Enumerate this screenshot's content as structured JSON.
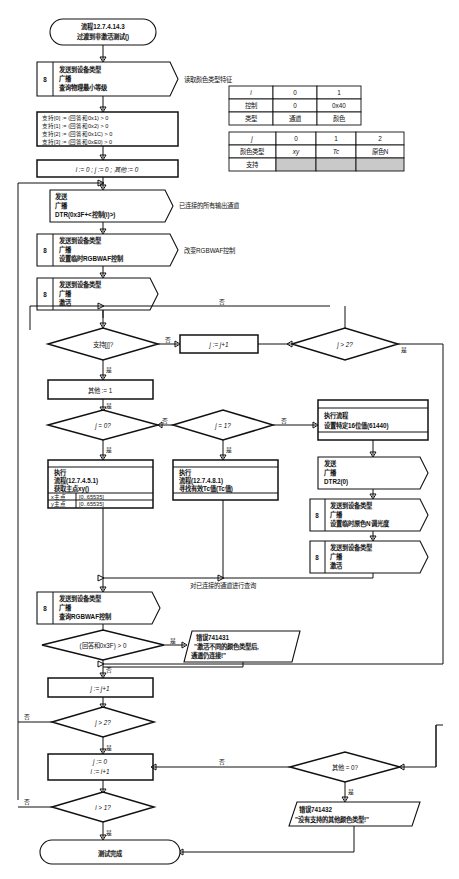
{
  "diagram": {
    "terminator_start_line1": "流程12.7.4.14.3",
    "terminator_start_line2": "过渡到非激活测试()",
    "terminator_end": "测试完成"
  },
  "nodes": {
    "cmd_query_min_level": {
      "badge": "8",
      "line1": "发送到设备类型",
      "line2": "广播",
      "line3": "查询物理最小等级",
      "note": "读取颜色类型特征"
    },
    "support_assign": {
      "line1": "支持[0] := (回答和0x1) > 0",
      "line2": "支持[1] := (回答和0x2) > 0",
      "line3": "支持[2] := (回答和0x1C) > 0",
      "line4": "支持[3] := (回答和0xE0) > 0"
    },
    "init_vars": {
      "text": "i := 0 ; j := 0 ; 其他 := 0"
    },
    "cmd_dtr": {
      "line1": "发送",
      "line2": "广播",
      "line3": "DTR(0x3F+<控制(i)>)",
      "note": "已连接的所有输出通道"
    },
    "cmd_set_temp_rgbwaf": {
      "badge": "8",
      "line1": "发送到设备类型",
      "line2": "广播",
      "line3": "设置临时RGBWAF控制",
      "note": "改变RGBWAF控制"
    },
    "cmd_activate_1": {
      "badge": "8",
      "line1": "发送到设备类型",
      "line2": "广播",
      "line3": "激活"
    },
    "dec_support_j": {
      "text": "支持[j]?"
    },
    "box_j_inc_top": {
      "text": "j := j+1"
    },
    "dec_j_gt2_top": {
      "text": "j > 2?"
    },
    "box_other_1": {
      "text": "其他 := 1"
    },
    "dec_j_eq0": {
      "text": "j = 0?"
    },
    "dec_j_eq1": {
      "text": "j = 1?"
    },
    "proc_get_primary": {
      "line1": "执行",
      "line2": "流程(12.7.4.5.1)",
      "line3": "获取主点xy()",
      "out1_label": "x主点",
      "out1_range": "[0..65535]",
      "out2_label": "y主点",
      "out2_range": "[0..65535]"
    },
    "proc_find_tc": {
      "line1": "执行",
      "line2": "流程(12.7.4.8.1)",
      "line3": "寻找有效Tc值(Tc值)"
    },
    "proc_set_16bit": {
      "line1": "执行流程",
      "line2": "设置特定16位值(61440)"
    },
    "cmd_dtr2": {
      "line1": "发送",
      "line2": "广播",
      "line3": "DTR2(0)"
    },
    "cmd_set_primary_n": {
      "badge": "8",
      "line1": "发送到设备类型",
      "line2": "广播",
      "line3": "设置临时原色N调光度"
    },
    "cmd_activate_2": {
      "badge": "8",
      "line1": "发送到设备类型",
      "line2": "广播",
      "line3": "激活"
    },
    "cmd_query_rgbwaf": {
      "badge": "8",
      "line1": "发送到设备类型",
      "line2": "广播",
      "line3": "查询RGBWAF控制",
      "note": "对已连接的通道进行查询"
    },
    "dec_answer_3f": {
      "text": "(回答和0x3F) > 0"
    },
    "err_741431": {
      "line1": "错误741431",
      "line2": "\"激活不同的颜色类型后,",
      "line3": "通道仍连接!\""
    },
    "box_j_inc_bottom": {
      "text": "j := j+1"
    },
    "dec_j_gt2_bottom": {
      "text": "j > 2?"
    },
    "box_reset_j_inc_i": {
      "line1": "j := 0",
      "line2": "i := i+1"
    },
    "dec_i_gt1": {
      "text": "i > 1?"
    },
    "dec_other_eq0": {
      "text": "其他 = 0?"
    },
    "err_741432": {
      "line1": "错误741432",
      "line2": "\"没有支持的其他颜色类型!\""
    }
  },
  "edge_labels": {
    "yes": "是",
    "no": "否"
  },
  "tables": {
    "table1": {
      "rows": [
        [
          "i",
          "0",
          "1"
        ],
        [
          "控制",
          "0",
          "0x40"
        ],
        [
          "类型",
          "通道",
          "颜色"
        ]
      ]
    },
    "table2": {
      "rows": [
        [
          "j",
          "0",
          "1",
          "2"
        ],
        [
          "颜色类型",
          "xy",
          "Tc",
          "原色N"
        ],
        [
          "支持",
          "",
          "",
          ""
        ]
      ]
    }
  },
  "colors": {
    "stroke": "#111111",
    "background": "#ffffff",
    "table_shade": "#c9c9c9"
  }
}
